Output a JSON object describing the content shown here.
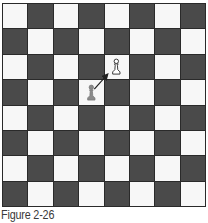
{
  "figure": {
    "caption": "Figure 2-26",
    "board": {
      "size": 8,
      "top_left_color": "light",
      "colors": {
        "light": "#f7f7f7",
        "dark": "#4a4a4a",
        "grid": "#2a2a2a"
      }
    },
    "pieces": [
      {
        "type": "pawn",
        "color": "white",
        "style": "outline",
        "row": 2,
        "col": 4
      },
      {
        "type": "pawn",
        "color": "gray",
        "style": "filled",
        "row": 3,
        "col": 3
      }
    ],
    "arrows": [
      {
        "from": {
          "row": 3,
          "col": 3
        },
        "to": {
          "row": 2,
          "col": 4
        },
        "meaning": "diagonal capture move"
      }
    ]
  }
}
